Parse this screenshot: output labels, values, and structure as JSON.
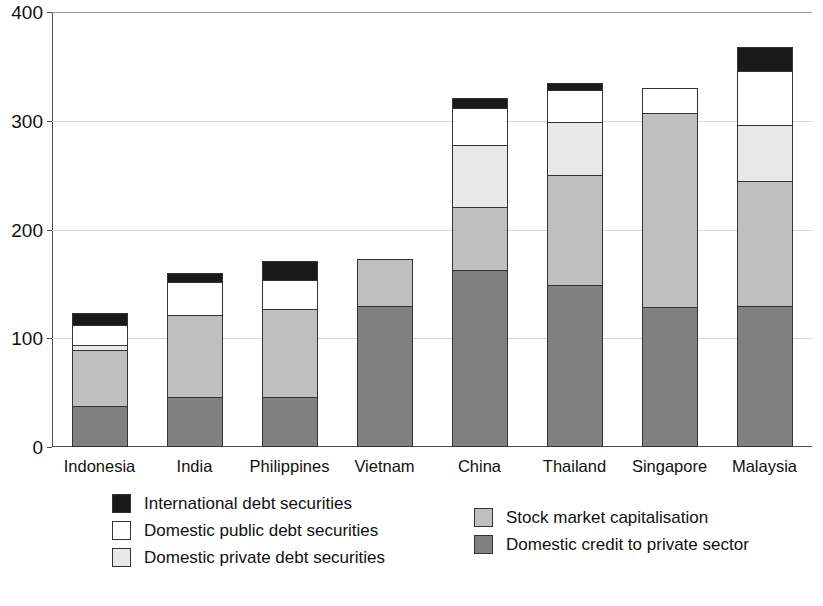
{
  "chart_data": {
    "type": "bar",
    "subtype": "stacked-bar",
    "title": "",
    "subtitle": "",
    "xlabel": "",
    "ylabel": "",
    "ylim": [
      0,
      400
    ],
    "yticks": [
      0,
      100,
      200,
      300,
      400
    ],
    "ytick_labels": [
      "0",
      "100",
      "200",
      "300",
      "400"
    ],
    "grid": true,
    "grid_axis": "y",
    "legend_position": "bottom",
    "categories": [
      "Indonesia",
      "India",
      "Philippines",
      "Vietnam",
      "China",
      "Thailand",
      "Singapore",
      "Malaysia"
    ],
    "series": [
      {
        "name": "Domestic credit to private sector",
        "color": "#808080",
        "values": [
          38,
          46,
          46,
          130,
          163,
          149,
          129,
          130
        ]
      },
      {
        "name": "Stock market capitalisation",
        "color": "#bfbfbf",
        "values": [
          51,
          75,
          81,
          43,
          58,
          101,
          178,
          115
        ]
      },
      {
        "name": "Domestic private debt securities",
        "color": "#e8e8e8",
        "values": [
          5,
          0,
          0,
          0,
          57,
          49,
          0,
          51
        ]
      },
      {
        "name": "Domestic public debt securities",
        "color": "#ffffff",
        "values": [
          18,
          31,
          27,
          0,
          34,
          29,
          23,
          50
        ]
      },
      {
        "name": "International debt securities",
        "color": "#1a1a1a",
        "values": [
          11,
          8,
          17,
          0,
          9,
          7,
          0,
          22
        ]
      }
    ],
    "totals": [
      123,
      160,
      171,
      173,
      321,
      335,
      330,
      368
    ]
  },
  "legend": {
    "left_column": [
      {
        "label": "International debt securities",
        "color": "#1a1a1a",
        "swatch": "international-debt-swatch"
      },
      {
        "label": "Domestic public debt securities",
        "color": "#ffffff",
        "swatch": "domestic-public-debt-swatch"
      },
      {
        "label": "Domestic private debt securities",
        "color": "#e8e8e8",
        "swatch": "domestic-private-debt-swatch"
      }
    ],
    "right_column": [
      {
        "label": "Stock market capitalisation",
        "color": "#bfbfbf",
        "swatch": "stock-market-swatch"
      },
      {
        "label": "Domestic credit to private sector",
        "color": "#808080",
        "swatch": "domestic-credit-swatch"
      }
    ]
  }
}
